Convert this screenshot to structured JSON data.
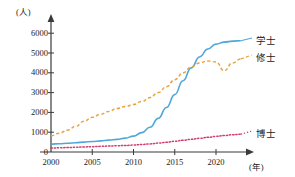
{
  "chart_data": {
    "type": "line",
    "title": "",
    "xlabel": "(年)",
    "ylabel": "(人)",
    "xlim": [
      2000,
      2023
    ],
    "ylim": [
      0,
      6500
    ],
    "grid": false,
    "legend_position": "right-inline",
    "xticks": [
      2000,
      2005,
      2010,
      2015,
      2020
    ],
    "xtick_labels": [
      "2000",
      "2005",
      "2010",
      "2015",
      "2020"
    ],
    "yticks": [
      0,
      1000,
      2000,
      3000,
      4000,
      5000,
      6000
    ],
    "ytick_labels": [
      "0",
      "1000",
      "2000",
      "3000",
      "4000",
      "5000",
      "6000"
    ],
    "x": [
      2000,
      2001,
      2002,
      2003,
      2004,
      2005,
      2006,
      2007,
      2008,
      2009,
      2010,
      2011,
      2012,
      2013,
      2014,
      2015,
      2016,
      2017,
      2018,
      2019,
      2020,
      2021,
      2022,
      2023
    ],
    "series": [
      {
        "name": "学士",
        "label": "学士",
        "color": "#4fa8d8",
        "style": "solid",
        "values": [
          400,
          420,
          440,
          470,
          500,
          530,
          560,
          600,
          640,
          700,
          800,
          980,
          1250,
          1700,
          2250,
          2900,
          3600,
          4250,
          4800,
          5200,
          5450,
          5550,
          5600,
          5620
        ]
      },
      {
        "name": "修士",
        "label": "修士",
        "color": "#e8a33d",
        "style": "dashed",
        "values": [
          820,
          950,
          1100,
          1300,
          1550,
          1750,
          1900,
          2050,
          2200,
          2300,
          2400,
          2550,
          2750,
          3000,
          3300,
          3650,
          4000,
          4300,
          4500,
          4600,
          4550,
          4100,
          4500,
          4700
        ]
      },
      {
        "name": "博士",
        "label": "博士",
        "color": "#d23b6a",
        "style": "dotted",
        "values": [
          200,
          210,
          225,
          240,
          255,
          270,
          285,
          300,
          315,
          330,
          350,
          380,
          410,
          450,
          490,
          540,
          590,
          640,
          690,
          740,
          790,
          830,
          870,
          900
        ]
      }
    ]
  },
  "axis": {
    "y_unit_label": "(人)",
    "x_unit_label": "(年)"
  }
}
